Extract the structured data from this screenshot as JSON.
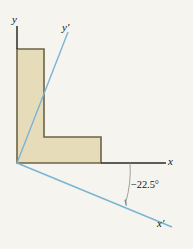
{
  "figure": {
    "background_color": "#f6f4ee",
    "labels": {
      "y_axis": "y",
      "y_prime_axis": "y′",
      "x_axis": "x",
      "x_prime_axis": "x′",
      "rotation_angle": "−22.5°"
    },
    "colors": {
      "primed_axis": "#7ab4d4",
      "principal_axis": "#2b2b2b",
      "shape_fill": "#e7dcba",
      "shape_stroke": "#6b6347",
      "arc": "#8a8a8a",
      "text": "#141414"
    },
    "geometry": {
      "origin": {
        "x": 17,
        "y": 163
      },
      "rotation_degrees": -22.5,
      "l_shape_vertices": [
        {
          "x": 17,
          "y": 163
        },
        {
          "x": 17,
          "y": 49
        },
        {
          "x": 44,
          "y": 49
        },
        {
          "x": 44,
          "y": 137
        },
        {
          "x": 101,
          "y": 137
        },
        {
          "x": 101,
          "y": 163
        }
      ],
      "y_axis_line": {
        "x1": 17,
        "y1": 26,
        "x2": 17,
        "y2": 49
      },
      "x_axis_line": {
        "x1": 101,
        "y1": 163,
        "x2": 166,
        "y2": 163
      },
      "y_prime_line": {
        "x1": 17,
        "y1": 163,
        "x2": 68,
        "y2": 32
      },
      "x_prime_line": {
        "x1": 17,
        "y1": 163,
        "x2": 172,
        "y2": 227
      },
      "angle_arc": {
        "cx": 17,
        "cy": 163,
        "radius": 113
      }
    }
  }
}
